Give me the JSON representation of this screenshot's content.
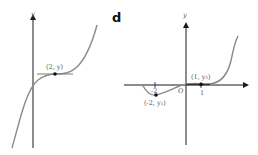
{
  "left_graph": {
    "y_axis_label": "y",
    "point_label": "(2, y)"
  },
  "right_graph": {
    "panel_label": "d",
    "y_axis_label": "y",
    "x_axis_label": "x",
    "origin_label": "O",
    "tick_labels": [
      "-2",
      "1"
    ],
    "point_labels": [
      "(-2, y₁)",
      "(1, y₂)"
    ]
  },
  "colors": {
    "axis": "#1a1a1a",
    "curve": "#8a8a8a",
    "point": "#111111"
  }
}
